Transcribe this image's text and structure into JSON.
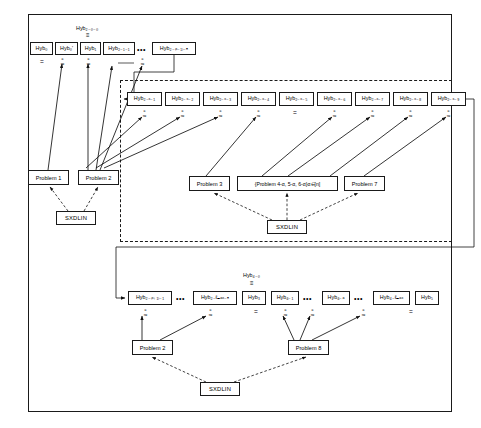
{
  "diagram": {
    "title_note": "Hybrid argument / security reduction diagram",
    "outer_border_color": "#1a1a1a",
    "background": "#ffffff"
  },
  "labels": {
    "hyb_2_0_0": "Hyb₂₋₀₋₀",
    "hyb_4_0": "Hyb₄₋₀",
    "equiv": "≡",
    "equals": "=",
    "ellipsis": "•••",
    "approx_c_super": "c",
    "approx_sym": "≈"
  },
  "row_top": {
    "name": "top-hybrid-row",
    "group_label": "Hyb₂₋₀₋₀",
    "group_equiv": "≡",
    "nodes": [
      {
        "id": "hyb0",
        "label": "Hyb₀",
        "x": 30,
        "y": 42,
        "w": 23,
        "h": 13
      },
      {
        "id": "hyb0p",
        "label": "Hyb₀'",
        "x": 55,
        "y": 42,
        "w": 23,
        "h": 13
      },
      {
        "id": "hyb1",
        "label": "Hyb₁",
        "x": 80,
        "y": 42,
        "w": 21,
        "h": 13
      },
      {
        "id": "hyb2_1_1",
        "label": "Hyb₂₋₁₋₁",
        "x": 103,
        "y": 42,
        "w": 32,
        "h": 13
      },
      {
        "id": "hyb2_x1_n",
        "label": "Hyb₂₋₍ₓ₋₁₎₋ₙ",
        "x": 152,
        "y": 42,
        "w": 44,
        "h": 13
      }
    ],
    "ellipsis_x": 137,
    "ellipsis_y": 46,
    "connectors": [
      {
        "type": "equals",
        "x": 40,
        "y": 59
      },
      {
        "type": "approx_c",
        "x": 61,
        "y": 57
      },
      {
        "type": "approx_c",
        "x": 86,
        "y": 57
      },
      {
        "type": "approx_c",
        "x": 141,
        "y": 57
      }
    ]
  },
  "row_middle": {
    "name": "middle-hybrid-row",
    "nodes": [
      {
        "id": "hyb2_x_1",
        "label": "Hyb₂₋ₓ₋₁",
        "x": 127,
        "y": 92,
        "w": 35,
        "h": 14
      },
      {
        "id": "hyb2_x_2",
        "label": "Hyb₂₋ₓ₋₂",
        "x": 165,
        "y": 92,
        "w": 35,
        "h": 14
      },
      {
        "id": "hyb2_x_3",
        "label": "Hyb₂₋ₓ₋₃",
        "x": 203,
        "y": 92,
        "w": 35,
        "h": 14
      },
      {
        "id": "hyb2_x_4",
        "label": "Hyb₂₋ₓ₋₄",
        "x": 241,
        "y": 92,
        "w": 35,
        "h": 14
      },
      {
        "id": "hyb2_x_5",
        "label": "Hyb₂₋ₓ₋₅",
        "x": 279,
        "y": 92,
        "w": 35,
        "h": 14
      },
      {
        "id": "hyb2_x_6",
        "label": "Hyb₂₋ₓ₋₆",
        "x": 317,
        "y": 92,
        "w": 35,
        "h": 14
      },
      {
        "id": "hyb2_x_7",
        "label": "Hyb₂₋ₓ₋₇",
        "x": 355,
        "y": 92,
        "w": 35,
        "h": 14
      },
      {
        "id": "hyb2_x_8",
        "label": "Hyb₂₋ₓ₋₈",
        "x": 393,
        "y": 92,
        "w": 35,
        "h": 14
      },
      {
        "id": "hyb2_x_9",
        "label": "Hyb₂₋ₓ₋₉",
        "x": 431,
        "y": 92,
        "w": 35,
        "h": 14
      }
    ],
    "connectors": [
      {
        "type": "approx_c",
        "x": 140,
        "y": 110
      },
      {
        "type": "approx_c",
        "x": 178,
        "y": 110
      },
      {
        "type": "approx_c",
        "x": 216,
        "y": 110
      },
      {
        "type": "approx_c",
        "x": 254,
        "y": 110
      },
      {
        "type": "equals",
        "x": 292,
        "y": 112
      },
      {
        "type": "approx_c",
        "x": 330,
        "y": 110
      },
      {
        "type": "approx_c",
        "x": 368,
        "y": 110
      },
      {
        "type": "approx_c",
        "x": 406,
        "y": 110
      },
      {
        "type": "approx_c",
        "x": 444,
        "y": 110
      }
    ]
  },
  "row_bottom": {
    "name": "bottom-hybrid-row",
    "group_label": "Hyb₄₋₀",
    "group_equiv": "≡",
    "nodes": [
      {
        "id": "hyb2_x1_1",
        "label": "Hyb₂₋₍ₓ₊₁₎₋₁",
        "x": 128,
        "y": 291,
        "w": 44,
        "h": 14
      },
      {
        "id": "hyb2_lmax_n",
        "label": "Hyb₂₋ℓₘₐₓ₋ₙ",
        "x": 193,
        "y": 291,
        "w": 44,
        "h": 14
      },
      {
        "id": "hyb3",
        "label": "Hyb₃",
        "x": 242,
        "y": 291,
        "w": 24,
        "h": 14
      },
      {
        "id": "hyb4_1",
        "label": "Hyb₄₋₁",
        "x": 271,
        "y": 291,
        "w": 28,
        "h": 14
      },
      {
        "id": "hyb4_a",
        "label": "Hyb₄₋ₐ",
        "x": 322,
        "y": 291,
        "w": 28,
        "h": 14
      },
      {
        "id": "hyb4_lmax",
        "label": "Hyb₄₋ℓₘₐₓ",
        "x": 373,
        "y": 291,
        "w": 37,
        "h": 14
      },
      {
        "id": "hyb5",
        "label": "Hyb₅",
        "x": 415,
        "y": 291,
        "w": 24,
        "h": 14
      }
    ],
    "ellipses": [
      {
        "x": 176,
        "y": 295
      },
      {
        "x": 303,
        "y": 295
      },
      {
        "x": 354,
        "y": 295
      }
    ],
    "connectors": [
      {
        "type": "approx_c",
        "x": 141,
        "y": 309
      },
      {
        "type": "approx_c",
        "x": 206,
        "y": 309
      },
      {
        "type": "equals",
        "x": 253,
        "y": 311
      },
      {
        "type": "approx_c",
        "x": 281,
        "y": 309
      },
      {
        "type": "approx_c",
        "x": 309,
        "y": 309
      },
      {
        "type": "approx_c",
        "x": 360,
        "y": 309
      },
      {
        "type": "equals",
        "x": 408,
        "y": 311
      }
    ]
  },
  "problems": [
    {
      "id": "problem1",
      "label": "Problem 1",
      "x": 28,
      "y": 170,
      "w": 41,
      "h": 15
    },
    {
      "id": "problem2a",
      "label": "Problem 2",
      "x": 78,
      "y": 170,
      "w": 41,
      "h": 15
    },
    {
      "id": "problem3",
      "label": "Problem 3",
      "x": 189,
      "y": 176,
      "w": 41,
      "h": 15
    },
    {
      "id": "problem456",
      "label": "{Problem 4-α, 5-α, 6-α}α∈[n]",
      "x": 237,
      "y": 176,
      "w": 101,
      "h": 15
    },
    {
      "id": "problem7",
      "label": "Problem 7",
      "x": 344,
      "y": 176,
      "w": 41,
      "h": 15
    },
    {
      "id": "problem2b",
      "label": "Problem 2",
      "x": 132,
      "y": 340,
      "w": 41,
      "h": 15
    },
    {
      "id": "problem8",
      "label": "Problem 8",
      "x": 288,
      "y": 340,
      "w": 41,
      "h": 15
    }
  ],
  "assumptions": [
    {
      "id": "sxdlin-left",
      "label": "SXDLIN",
      "x": 56,
      "y": 211,
      "w": 40,
      "h": 14
    },
    {
      "id": "sxdlin-middle",
      "label": "SXDLIN",
      "x": 267,
      "y": 220,
      "w": 40,
      "h": 14
    },
    {
      "id": "sxdlin-bottom",
      "label": "SXDLIN",
      "x": 200,
      "y": 382,
      "w": 40,
      "h": 14
    }
  ],
  "frames": {
    "outer": {
      "x": 28,
      "y": 14,
      "w": 424,
      "h": 398
    },
    "dashed": {
      "x": 120,
      "y": 80,
      "w": 332,
      "h": 162
    },
    "rail_top": {
      "x": 134,
      "y": 64,
      "w": 318,
      "h": 180
    },
    "rail_bottom": {
      "x": 116,
      "y": 247,
      "w": 336,
      "h": 51
    }
  }
}
